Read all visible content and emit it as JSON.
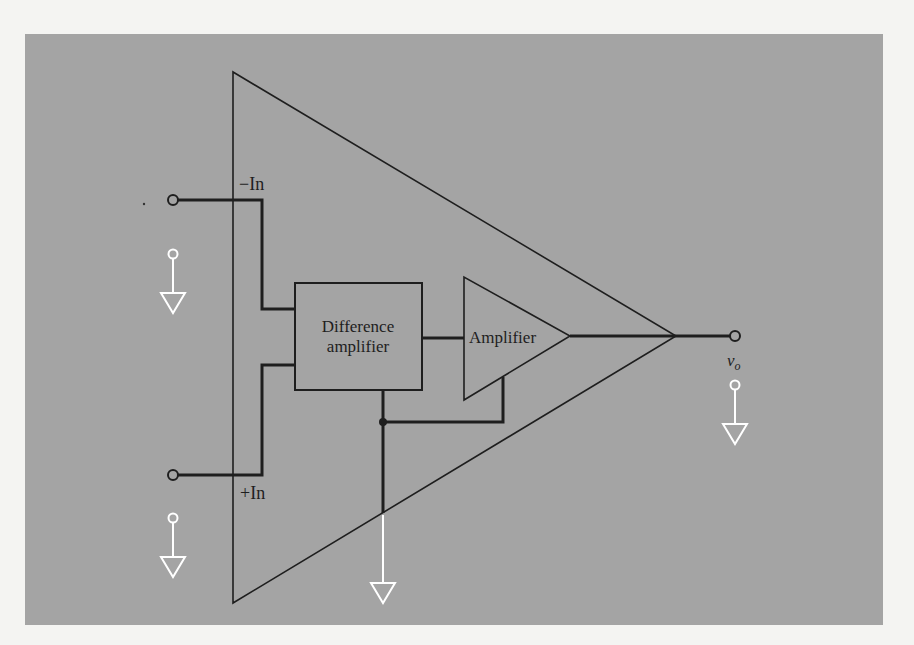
{
  "figure": {
    "panel_color": "#a4a4a4",
    "page_color": "#f4f4f2",
    "line_color": "#1e1e1e",
    "ground_color": "#ffffff"
  },
  "labels": {
    "inverting_input": "−In",
    "noninverting_input": "+In",
    "difference_amplifier_line1": "Difference",
    "difference_amplifier_line2": "amplifier",
    "amplifier": "Amplifier",
    "output_v": "v",
    "output_sub": "o"
  },
  "blocks": [
    {
      "id": "outer-op-amp",
      "shape": "triangle"
    },
    {
      "id": "difference-amplifier",
      "shape": "rectangle"
    },
    {
      "id": "amplifier",
      "shape": "triangle"
    }
  ],
  "terminals": [
    "−In",
    "+In",
    "v_o"
  ],
  "grounds": [
    "inverting-input-ground",
    "noninverting-input-ground",
    "common-ground",
    "output-ground"
  ]
}
